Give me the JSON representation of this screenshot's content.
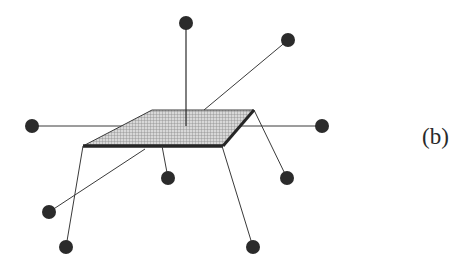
{
  "figure": {
    "label": "(b)",
    "colors": {
      "node": "#2b2b2b",
      "line": "#3a3a3a",
      "plate_fill": "#bdbdbd",
      "plate_edge": "#262626",
      "background": "#ffffff"
    }
  },
  "plate": {
    "corners": [
      [
        152,
        110
      ],
      [
        254,
        110
      ],
      [
        223,
        146
      ],
      [
        83,
        146
      ]
    ]
  },
  "nodes": [
    {
      "id": "top",
      "x": 186,
      "y": 23
    },
    {
      "id": "top-right",
      "x": 288,
      "y": 40
    },
    {
      "id": "left",
      "x": 32,
      "y": 126
    },
    {
      "id": "right",
      "x": 322,
      "y": 126
    },
    {
      "id": "center-below",
      "x": 168,
      "y": 178
    },
    {
      "id": "right-below",
      "x": 287,
      "y": 178
    },
    {
      "id": "left-lower",
      "x": 49,
      "y": 212
    },
    {
      "id": "bottom-left",
      "x": 66,
      "y": 247
    },
    {
      "id": "bottom-right",
      "x": 253,
      "y": 247
    }
  ],
  "edges": [
    {
      "from": [
        186,
        126
      ],
      "to": [
        186,
        23
      ]
    },
    {
      "from": [
        204,
        110
      ],
      "to": [
        288,
        40
      ]
    },
    {
      "from": [
        32,
        126
      ],
      "to": [
        322,
        126
      ]
    },
    {
      "from": [
        162,
        146
      ],
      "to": [
        168,
        178
      ]
    },
    {
      "from": [
        254,
        110
      ],
      "to": [
        287,
        178
      ]
    },
    {
      "from": [
        145,
        149
      ],
      "to": [
        49,
        212
      ]
    },
    {
      "from": [
        83,
        146
      ],
      "to": [
        66,
        247
      ]
    },
    {
      "from": [
        222,
        146
      ],
      "to": [
        253,
        247
      ]
    }
  ]
}
